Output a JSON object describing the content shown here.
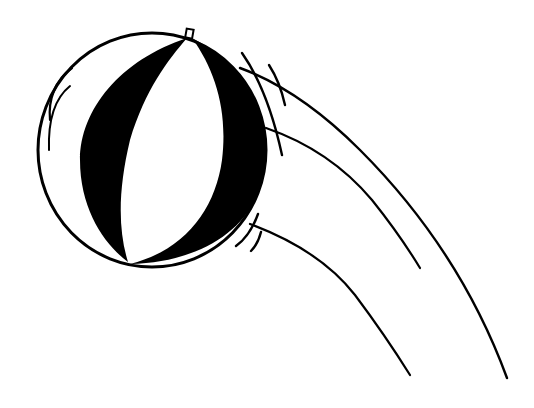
{
  "illustration": {
    "subject": "beach ball in motion",
    "style": "black and white line art",
    "colors": {
      "ink": "#000000",
      "paper": "#ffffff"
    },
    "elements": [
      {
        "name": "beach-ball",
        "description": "round ball with two black panels"
      },
      {
        "name": "motion-lines",
        "description": "three curved trails to the lower right"
      },
      {
        "name": "speed-strokes",
        "description": "short cross strokes near ball edge"
      }
    ]
  }
}
